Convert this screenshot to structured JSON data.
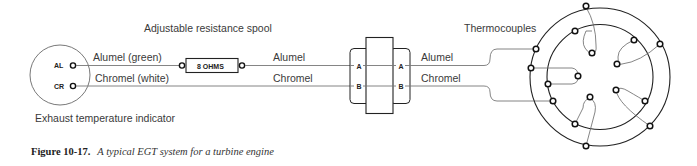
{
  "diagram": {
    "title_label": "Adjustable resistance spool",
    "indicator": {
      "label": "Exhaust temperature indicator",
      "terminals": [
        "AL",
        "CR"
      ]
    },
    "left_wires": {
      "alumel": "Alumel (green)",
      "chromel": "Chromel (white)"
    },
    "resistor": {
      "label": "8 OHMS"
    },
    "middle_wires": {
      "alumel": "Alumel",
      "chromel": "Chromel"
    },
    "connector": {
      "left_pins": [
        "A",
        "B"
      ],
      "right_pins": [
        "A",
        "B"
      ]
    },
    "right_wires": {
      "alumel": "Alumel",
      "chromel": "Chromel"
    },
    "thermocouples_label": "Thermocouples"
  },
  "caption": {
    "number": "Figure 10-17.",
    "text": "A typical EGT system for a turbine engine"
  }
}
